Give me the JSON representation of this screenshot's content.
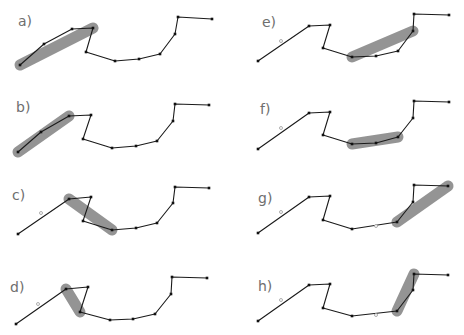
{
  "figure": {
    "panels": [
      {
        "label": "a)",
        "label_pos": [
          18,
          26
        ],
        "points": [
          [
            20,
            65
          ],
          [
            44,
            44
          ],
          [
            72,
            29
          ],
          [
            93,
            28
          ],
          [
            86,
            52
          ],
          [
            115,
            61
          ],
          [
            139,
            59
          ],
          [
            160,
            54
          ],
          [
            175,
            34
          ],
          [
            178,
            17
          ],
          [
            212,
            19
          ]
        ],
        "markers": [],
        "highlight": [
          [
            20,
            65
          ],
          [
            93,
            28
          ]
        ]
      },
      {
        "label": "b)",
        "label_pos": [
          16,
          112
        ],
        "points": [
          [
            18,
            152
          ],
          [
            41,
            132
          ],
          [
            69,
            116
          ],
          [
            91,
            115
          ],
          [
            83,
            139
          ],
          [
            112,
            148
          ],
          [
            136,
            146
          ],
          [
            157,
            141
          ],
          [
            173,
            121
          ],
          [
            175,
            104
          ],
          [
            209,
            105
          ]
        ],
        "markers": [],
        "highlight": [
          [
            18,
            152
          ],
          [
            69,
            116
          ]
        ]
      },
      {
        "label": "c)",
        "label_pos": [
          12,
          200
        ],
        "points": [
          [
            18,
            234
          ],
          [
            69,
            199
          ],
          [
            91,
            197
          ],
          [
            83,
            221
          ],
          [
            112,
            230
          ],
          [
            136,
            228
          ],
          [
            157,
            223
          ],
          [
            173,
            203
          ],
          [
            175,
            187
          ],
          [
            209,
            188
          ]
        ],
        "markers": [
          [
            41,
            213
          ]
        ],
        "highlight": [
          [
            69,
            199
          ],
          [
            112,
            230
          ]
        ]
      },
      {
        "label": "d)",
        "label_pos": [
          10,
          292
        ],
        "points": [
          [
            16,
            324
          ],
          [
            66,
            289
          ],
          [
            88,
            287
          ],
          [
            80,
            312
          ],
          [
            110,
            320
          ],
          [
            133,
            319
          ],
          [
            155,
            314
          ],
          [
            171,
            294
          ],
          [
            172,
            277
          ],
          [
            207,
            278
          ]
        ],
        "markers": [
          [
            38,
            304
          ]
        ],
        "highlight": [
          [
            66,
            289
          ],
          [
            80,
            312
          ]
        ]
      },
      {
        "label": "e)",
        "label_pos": [
          262,
          27
        ],
        "points": [
          [
            258,
            61
          ],
          [
            309,
            26
          ],
          [
            330,
            25
          ],
          [
            323,
            48
          ],
          [
            352,
            57
          ],
          [
            376,
            56
          ],
          [
            398,
            51
          ],
          [
            413,
            31
          ],
          [
            414,
            14
          ],
          [
            449,
            15
          ]
        ],
        "markers": [
          [
            281,
            41
          ]
        ],
        "highlight": [
          [
            352,
            57
          ],
          [
            413,
            31
          ]
        ]
      },
      {
        "label": "f)",
        "label_pos": [
          260,
          114
        ],
        "points": [
          [
            258,
            149
          ],
          [
            309,
            113
          ],
          [
            330,
            112
          ],
          [
            323,
            135
          ],
          [
            352,
            144
          ],
          [
            376,
            143
          ],
          [
            398,
            137
          ],
          [
            413,
            118
          ],
          [
            414,
            101
          ],
          [
            449,
            102
          ]
        ],
        "markers": [
          [
            281,
            128
          ]
        ],
        "highlight": [
          [
            352,
            144
          ],
          [
            398,
            137
          ]
        ]
      },
      {
        "label": "g)",
        "label_pos": [
          258,
          203
        ],
        "points": [
          [
            258,
            233
          ],
          [
            309,
            197
          ],
          [
            330,
            196
          ],
          [
            323,
            220
          ],
          [
            352,
            229
          ],
          [
            397,
            222
          ],
          [
            413,
            202
          ],
          [
            414,
            185
          ],
          [
            448,
            186
          ]
        ],
        "markers": [
          [
            281,
            212
          ],
          [
            376,
            226
          ]
        ],
        "highlight": [
          [
            397,
            222
          ],
          [
            448,
            186
          ]
        ]
      },
      {
        "label": "h)",
        "label_pos": [
          258,
          291
        ],
        "points": [
          [
            258,
            321
          ],
          [
            309,
            285
          ],
          [
            330,
            284
          ],
          [
            323,
            308
          ],
          [
            352,
            316
          ],
          [
            397,
            311
          ],
          [
            413,
            290
          ],
          [
            414,
            274
          ],
          [
            448,
            275
          ]
        ],
        "markers": [
          [
            281,
            300
          ],
          [
            376,
            315
          ]
        ],
        "highlight": [
          [
            397,
            311
          ],
          [
            414,
            274
          ]
        ]
      }
    ],
    "colors": {
      "line": "#1a1a1a",
      "vertex": "#111111",
      "highlight": "#7d7d7d",
      "label": "#6e6e6e",
      "marker_stroke": "#9a9a9a"
    }
  }
}
